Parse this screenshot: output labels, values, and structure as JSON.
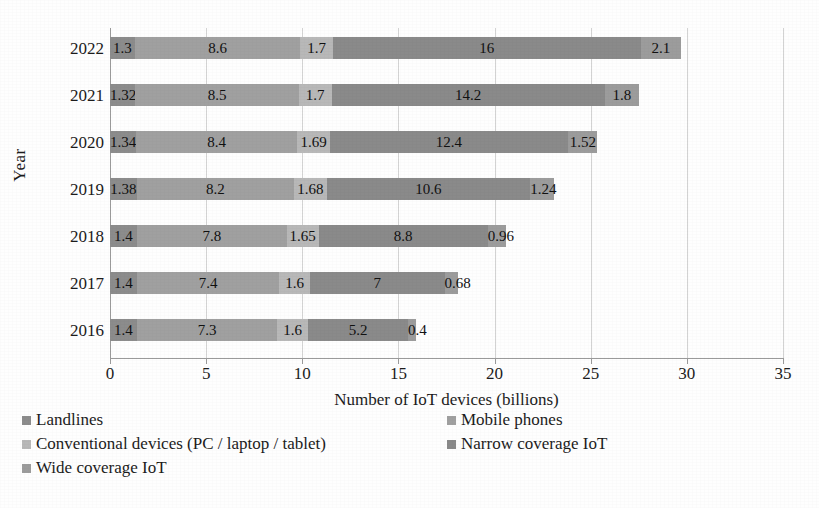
{
  "chart_data": {
    "type": "bar",
    "orientation": "horizontal",
    "stacked": true,
    "title": "",
    "xlabel": "Number of IoT devices (billions)",
    "ylabel": "Year",
    "xlim": [
      0,
      35
    ],
    "xticks": [
      0,
      5,
      10,
      15,
      20,
      25,
      30,
      35
    ],
    "grid": true,
    "legend_position": "bottom",
    "categories": [
      "2022",
      "2021",
      "2020",
      "2019",
      "2018",
      "2017",
      "2016"
    ],
    "series": [
      {
        "name": "Landlines",
        "color": "#8c8c8c",
        "values": [
          1.3,
          1.32,
          1.34,
          1.38,
          1.4,
          1.4,
          1.4
        ],
        "labels": [
          "1.3",
          "1.32",
          "1.34",
          "1.38",
          "1.4",
          "1.4",
          "1.4"
        ]
      },
      {
        "name": "Mobile phones",
        "color": "#a0a0a0",
        "values": [
          8.6,
          8.5,
          8.4,
          8.2,
          7.8,
          7.4,
          7.3
        ],
        "labels": [
          "8.6",
          "8.5",
          "8.4",
          "8.2",
          "7.8",
          "7.4",
          "7.3"
        ]
      },
      {
        "name": "Conventional devices (PC / laptop / tablet)",
        "color": "#b8b8b8",
        "values": [
          1.7,
          1.7,
          1.69,
          1.68,
          1.65,
          1.6,
          1.6
        ],
        "labels": [
          "1.7",
          "1.7",
          "1.69",
          "1.68",
          "1.65",
          "1.6",
          "1.6"
        ]
      },
      {
        "name": "Narrow coverage IoT",
        "color": "#8a8a8a",
        "values": [
          16,
          14.2,
          12.4,
          10.6,
          8.8,
          7,
          5.2
        ],
        "labels": [
          "16",
          "14.2",
          "12.4",
          "10.6",
          "8.8",
          "7",
          "5.2"
        ]
      },
      {
        "name": "Wide coverage IoT",
        "color": "#9c9c9c",
        "values": [
          2.1,
          1.8,
          1.52,
          1.24,
          0.96,
          0.68,
          0.4
        ],
        "labels": [
          "2.1",
          "1.8",
          "1.52",
          "1.24",
          "0.96",
          "0.68",
          "0.4"
        ]
      }
    ],
    "totals": [
      29.7,
      27.52,
      25.35,
      23.1,
      20.61,
      18.08,
      15.9
    ]
  },
  "axis": {
    "y_title": "Year",
    "x_title": "Number of IoT devices (billions)",
    "x_tick_labels": [
      "0",
      "5",
      "10",
      "15",
      "20",
      "25",
      "30",
      "35"
    ],
    "y_tick_labels": [
      "2022",
      "2021",
      "2020",
      "2019",
      "2018",
      "2017",
      "2016"
    ]
  },
  "legend": {
    "rows": [
      [
        "Landlines",
        "Mobile phones"
      ],
      [
        "Conventional devices (PC / laptop / tablet)",
        "Narrow coverage IoT"
      ],
      [
        "Wide coverage IoT"
      ]
    ]
  },
  "colors": {
    "grid": "#d3d3d3",
    "axis": "#9a9a9a",
    "text": "#1c1c1c",
    "background": "#fefefe"
  }
}
